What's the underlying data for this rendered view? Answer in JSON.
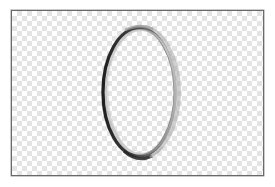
{
  "canvas": {
    "background": "transparent-checkerboard",
    "checker_colors": [
      "#ffffff",
      "#e4e4e4"
    ],
    "border_color": "#6a6a6a"
  },
  "shape": {
    "type": "ellipse-ring",
    "stroke_dark": "#2a2a2a",
    "stroke_mid": "#6e6e6e",
    "stroke_light": "#b8b8b8"
  }
}
